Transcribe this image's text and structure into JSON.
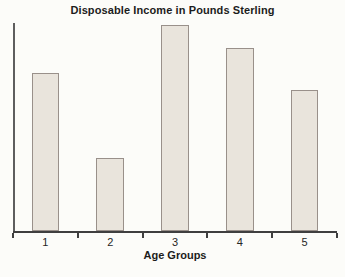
{
  "colors": {
    "background": "#fcfcf9",
    "bar_fill": "#e9e4dc",
    "bar_border": "#99908a",
    "x_axis": "#3f3f3f",
    "y_axis": "#5e5e5e",
    "text": "#1c1c1c"
  },
  "chart_data": {
    "type": "bar",
    "title": "Disposable Income in Pounds Sterling",
    "xlabel": "Age Groups",
    "ylabel": "",
    "categories": [
      "1",
      "2",
      "3",
      "4",
      "5"
    ],
    "values": [
      76,
      35,
      99,
      88,
      68
    ],
    "ylim": [
      0,
      100
    ],
    "grid": false,
    "legend": false
  }
}
